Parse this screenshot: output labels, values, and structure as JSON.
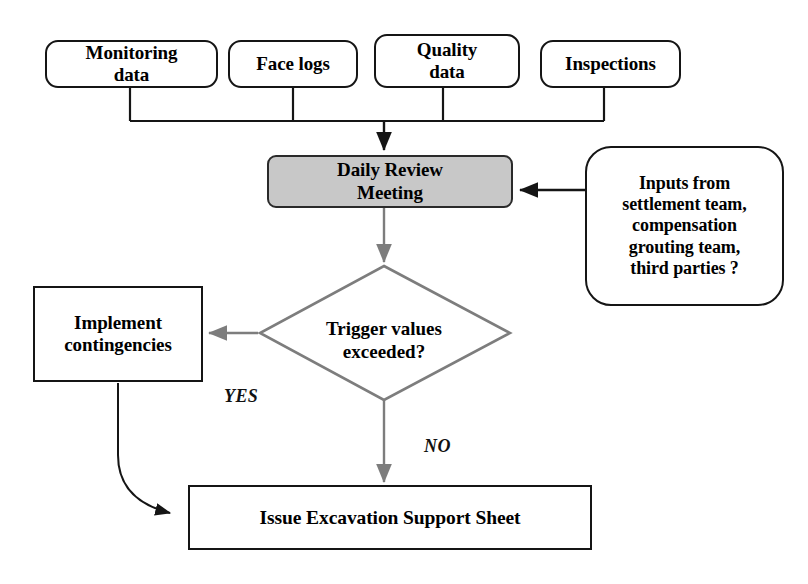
{
  "diagram": {
    "colors": {
      "stroke_black": "#151515",
      "stroke_gray": "#808080",
      "process_fill": "#c8c8c8",
      "background": "#ffffff"
    },
    "inputs": [
      {
        "id": "monitoring-data",
        "label": "Monitoring\ndata"
      },
      {
        "id": "face-logs",
        "label": "Face logs"
      },
      {
        "id": "quality-data",
        "label": "Quality\ndata"
      },
      {
        "id": "inspections",
        "label": "Inspections"
      }
    ],
    "process": {
      "id": "daily-review-meeting",
      "label": "Daily Review\nMeeting"
    },
    "note": {
      "id": "external-inputs",
      "label": "Inputs from\nsettlement team,\ncompensation\ngrouting team,\nthird parties ?"
    },
    "decision": {
      "id": "trigger-values",
      "label": "Trigger values\nexceeded?"
    },
    "contingency": {
      "id": "implement-contingencies",
      "label": "Implement\ncontingencies"
    },
    "output": {
      "id": "issue-excavation-support-sheet",
      "label": "Issue Excavation Support Sheet"
    },
    "edge_labels": {
      "yes": "YES",
      "no": "NO"
    }
  }
}
